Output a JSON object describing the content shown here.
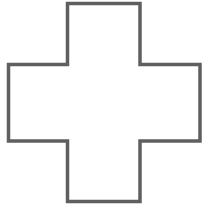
{
  "figure": {
    "shape": "cross",
    "stroke_color": "#5f5f5f",
    "fill_color": "#ffffff",
    "stroke_width": 3.5,
    "points": "67.5,3.5 140,3.5 140,64.5 200,64.5 200,141 140,141 140,201.5 67.5,201.5 67.5,141 8.5,141 8.5,64.5 67.5,64.5"
  }
}
